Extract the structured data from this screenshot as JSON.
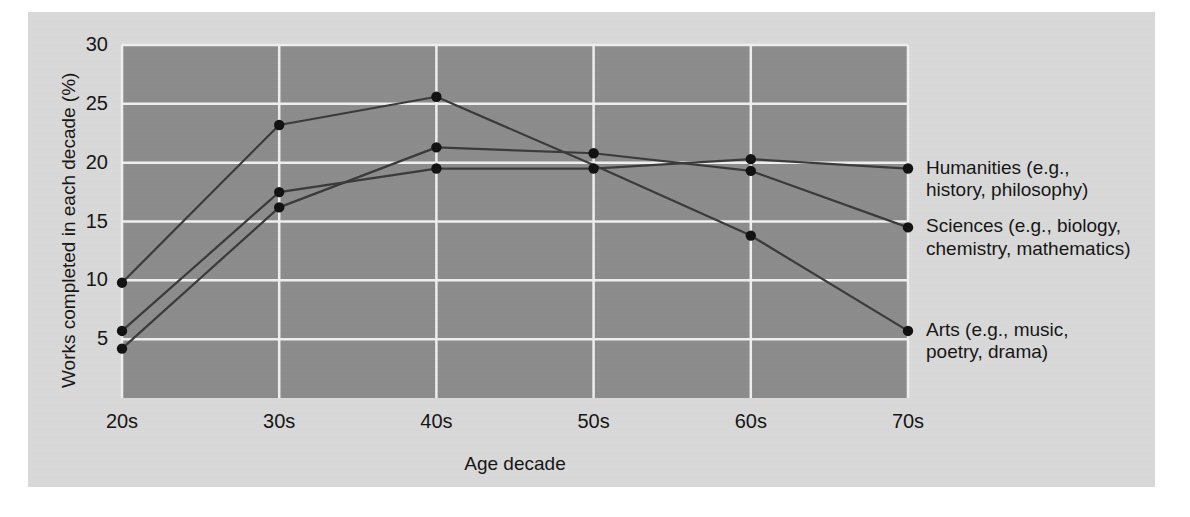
{
  "figure": {
    "panel_bg": "#d9d9d9",
    "plot_bg": "#8c8c8c",
    "grid_color": "#efefef",
    "line_color": "#3a3a3a",
    "marker_color": "#111111"
  },
  "chart_data": {
    "type": "line",
    "title": "",
    "xlabel": "Age decade",
    "ylabel": "Works completed in each decade (%)",
    "categories": [
      "20s",
      "30s",
      "40s",
      "50s",
      "60s",
      "70s"
    ],
    "x_tick_labels": [
      "20s",
      "30s",
      "40s",
      "50s",
      "60s",
      "70s"
    ],
    "y_tick_labels": [
      "5",
      "10",
      "15",
      "20",
      "25",
      "30"
    ],
    "y_ticks": [
      5,
      10,
      15,
      20,
      25,
      30
    ],
    "ylim": [
      0,
      30
    ],
    "grid": "horizontal-and-vertical",
    "legend_position": "right-of-axes-inline",
    "series": [
      {
        "name": "Humanities (e.g., history, philosophy)",
        "label_line1": "Humanities (e.g.,",
        "label_line2": "history, philosophy)",
        "values": [
          5.7,
          17.5,
          19.5,
          19.5,
          20.3,
          19.5
        ],
        "marker_visible": [
          true,
          true,
          true,
          true,
          true,
          true
        ]
      },
      {
        "name": "Sciences (e.g., biology, chemistry, mathematics)",
        "label_line1": "Sciences (e.g., biology,",
        "label_line2": "chemistry, mathematics)",
        "values": [
          4.2,
          16.2,
          21.3,
          20.8,
          19.3,
          14.5
        ],
        "marker_visible": [
          true,
          true,
          true,
          true,
          true,
          true
        ]
      },
      {
        "name": "Arts (e.g., music, poetry, drama)",
        "label_line1": "Arts (e.g., music,",
        "label_line2": "poetry, drama)",
        "values": [
          9.8,
          23.2,
          25.6,
          19.8,
          13.8,
          5.7
        ],
        "marker_visible": [
          true,
          true,
          true,
          false,
          true,
          true
        ]
      }
    ]
  }
}
